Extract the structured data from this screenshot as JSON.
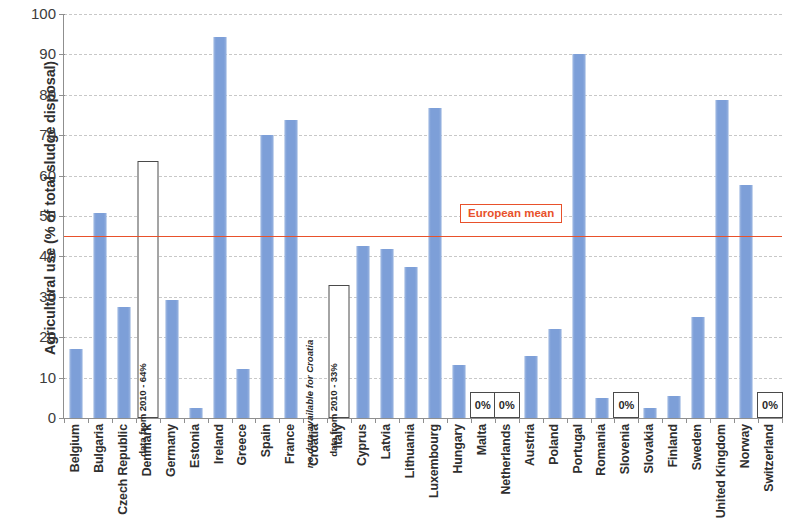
{
  "chart_data": {
    "type": "bar",
    "title": "",
    "xlabel": "",
    "ylabel": "Agricultural use (% of total sludge disposal)",
    "ylim": [
      0,
      100
    ],
    "ytick_labels": [
      "100",
      "90",
      "80",
      "70",
      "60",
      "50",
      "40",
      "30",
      "20",
      "10",
      "0"
    ],
    "ytick_values": [
      100,
      90,
      80,
      70,
      60,
      50,
      40,
      30,
      20,
      10,
      0
    ],
    "grid": true,
    "legend_position": "none",
    "bar_color": "#7d9fd8",
    "mean_line_color": "#e8512b",
    "categories": [
      "Belgium",
      "Bulgaria",
      "Czech Republic",
      "Denmark",
      "Germany",
      "Estonia",
      "Ireland",
      "Greece",
      "Spain",
      "France",
      "Croatia",
      "Italy",
      "Cyprus",
      "Latvia",
      "Lithuania",
      "Luxembourg",
      "Hungary",
      "Malta",
      "Netherlands",
      "Austria",
      "Poland",
      "Portugal",
      "Romania",
      "Slovenia",
      "Slovakia",
      "Finland",
      "Sweden",
      "United Kingdom",
      "Norway",
      "Switzerland"
    ],
    "values": [
      17.0,
      50.7,
      27.5,
      63.6,
      29.3,
      2.5,
      94.4,
      12.2,
      70.0,
      73.7,
      null,
      33.0,
      42.5,
      41.8,
      37.3,
      76.8,
      13.0,
      0,
      0,
      15.3,
      22.0,
      90.0,
      5.0,
      0,
      2.5,
      5.5,
      25.0,
      78.8,
      57.8,
      0
    ],
    "bar_styles": [
      "filled",
      "filled",
      "filled",
      "hollow",
      "filled",
      "filled",
      "filled",
      "filled",
      "filled",
      "filled",
      "none",
      "hollow",
      "filled",
      "filled",
      "filled",
      "filled",
      "filled",
      "zero",
      "zero",
      "filled",
      "filled",
      "filled",
      "filled",
      "zero",
      "filled",
      "filled",
      "filled",
      "filled",
      "filled",
      "zero"
    ],
    "annotations": [
      {
        "category": "Denmark",
        "text": "data from 2010 - 64%",
        "style": "rotated-bold"
      },
      {
        "category": "Croatia",
        "text": "no data available for Croatia",
        "style": "rotated-italic"
      },
      {
        "category": "Italy",
        "text": "data from 2010 - 33%",
        "style": "rotated-bold"
      },
      {
        "category": "Malta",
        "text": "0%",
        "style": "zero-box"
      },
      {
        "category": "Netherlands",
        "text": "0%",
        "style": "zero-box"
      },
      {
        "category": "Slovenia",
        "text": "0%",
        "style": "zero-box"
      },
      {
        "category": "Switzerland",
        "text": "0%",
        "style": "zero-box"
      }
    ],
    "reference_line": {
      "label": "European mean",
      "value": 45.0
    }
  }
}
